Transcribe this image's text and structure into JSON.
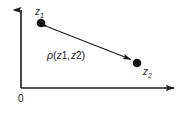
{
  "figure": {
    "type": "diagram",
    "background_color": "#ffffff",
    "ink_color": "#1a1a1a",
    "axes": {
      "origin_label": "0",
      "vertical_axis": {
        "name": "vertical-axis",
        "x": 21,
        "y_top": 6,
        "y_bottom": 88,
        "arrow_at": "top"
      },
      "horizontal_axis": {
        "name": "horizontal-axis",
        "y": 88,
        "x_left": 21,
        "x_right": 178,
        "arrow_at": "right"
      }
    },
    "points": [
      {
        "id": "z1",
        "label": "z",
        "subscript": "1",
        "x": 41,
        "y": 23,
        "radius": 4.2
      },
      {
        "id": "z2",
        "label": "z",
        "subscript": "2",
        "x": 137,
        "y": 63,
        "radius": 4.2
      }
    ],
    "connector": {
      "name": "distance-arrow",
      "from": {
        "x": 41,
        "y": 23
      },
      "to": {
        "x": 137,
        "y": 63
      },
      "double_headed": true,
      "label": {
        "symbol": "ρ",
        "open_paren": "(",
        "arg1": "z",
        "arg1_sub": "1",
        "separator": ",",
        "arg2": "z",
        "arg2_sub": "2",
        "close_paren": ")",
        "full_text": "ρ(z1 , z2)"
      }
    }
  }
}
